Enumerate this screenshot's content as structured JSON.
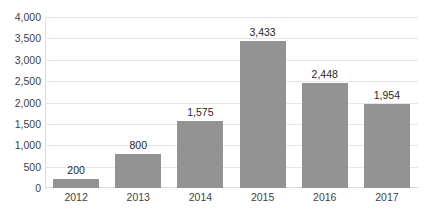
{
  "chart_data": {
    "type": "bar",
    "title": "",
    "subtitle": "",
    "xlabel": "",
    "ylabel": "",
    "categories": [
      "2012",
      "2013",
      "2014",
      "2015",
      "2016",
      "2017"
    ],
    "values": [
      200,
      800,
      1575,
      3433,
      2448,
      1954
    ],
    "value_labels": [
      "200",
      "800",
      "1,575",
      "3,433",
      "2,448",
      "1,954"
    ],
    "ylim": [
      0,
      4000
    ],
    "y_ticks": [
      0,
      500,
      1000,
      1500,
      2000,
      2500,
      3000,
      3500,
      4000
    ],
    "y_tick_labels": [
      "0",
      "500",
      "1,000",
      "1,500",
      "2,000",
      "2,500",
      "3,000",
      "3,500",
      "4,000"
    ],
    "grid": true,
    "grid_axis": "y",
    "legend": false,
    "legend_position": "none",
    "series": [
      {
        "name": "",
        "values": [
          200,
          800,
          1575,
          3433,
          2448,
          1954
        ],
        "color": "#939393"
      }
    ],
    "colors": {
      "bar": "#939393",
      "gridline": "#e6e6e6",
      "axis": "#dcdcdc",
      "tick_text": "#3f3f3f",
      "value_text": "#272727",
      "background": "#ffffff"
    }
  }
}
